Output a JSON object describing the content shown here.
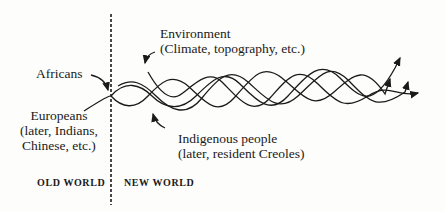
{
  "diagram": {
    "labels": {
      "africans": "Africans",
      "europeans": [
        "Europeans",
        "(later, Indians,",
        "Chinese, etc.)"
      ],
      "environment": [
        "Environment",
        "(Climate, topography, etc.)"
      ],
      "indigenous": [
        "Indigenous people",
        "(later, resident Creoles)"
      ],
      "old_world": "OLD WORLD",
      "new_world": "NEW WORLD"
    },
    "colors": {
      "ink": "#1a1a1a",
      "background": "#fdfdfb"
    }
  }
}
